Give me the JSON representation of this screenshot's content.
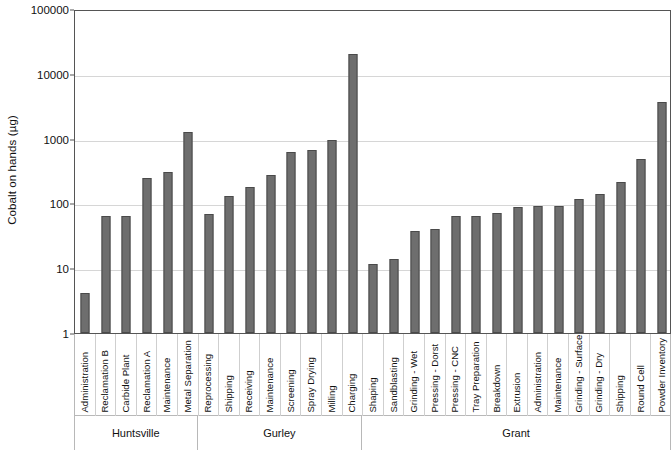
{
  "chart_data": {
    "type": "bar",
    "title": "",
    "xlabel": "",
    "ylabel": "Cobalt on hands (µg)",
    "yscale": "log",
    "ylim": [
      1,
      100000
    ],
    "ytick_labels": [
      "100000",
      "10000",
      "1000",
      "100",
      "10",
      "1"
    ],
    "ytick_values": [
      100000,
      10000,
      1000,
      100,
      10,
      1
    ],
    "grid": true,
    "legend": "none",
    "bar_color": "#6e6e6e",
    "bar_edge_color": "#4a4a4a",
    "categories": [
      "Administration",
      "Reclamation B",
      "Carbide Plant",
      "Reclamation A",
      "Maintenance",
      "Metal Separation",
      "Reprocessing",
      "Shipping",
      "Receiving",
      "Maintenance",
      "Screening",
      "Spray Drying",
      "Milling",
      "Charging",
      "Shaping",
      "Sandblasting",
      "Grinding - Wet",
      "Pressing - Dorst",
      "Pressing - CNC",
      "Tray Preparation",
      "Breakdown",
      "Extrusion",
      "Administration",
      "Maintenance",
      "Grinding - Surface",
      "Grinding - Dry",
      "Shipping",
      "Round Cell",
      "Powder Inventory"
    ],
    "values": [
      4.2,
      64,
      64,
      250,
      310,
      1250,
      68,
      130,
      180,
      275,
      620,
      660,
      950,
      20000,
      11.8,
      14,
      37,
      40,
      63,
      64,
      70,
      88,
      92,
      90,
      115,
      140,
      215,
      490,
      3700
    ],
    "groups": [
      {
        "label": "Huntsville",
        "start": 0,
        "count": 6
      },
      {
        "label": "Gurley",
        "start": 6,
        "count": 8
      },
      {
        "label": "Grant",
        "start": 14,
        "count": 15
      }
    ]
  }
}
